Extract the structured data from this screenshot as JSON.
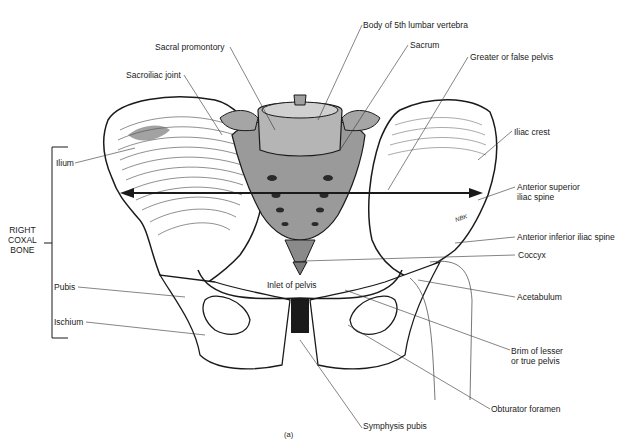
{
  "figure": {
    "caption": "(a)",
    "bracket_label": [
      "RIGHT",
      "COXAL",
      "BONE"
    ],
    "labels": {
      "sacral_promontory": "Sacral promontory",
      "sacroiliac_joint": "Sacroiliac joint",
      "body_5th_lumbar": "Body of 5th lumbar vertebra",
      "sacrum": "Sacrum",
      "greater_false_pelvis": "Greater or false pelvis",
      "iliac_crest": "Iliac crest",
      "asis_line1": "Anterior superior",
      "asis_line2": "iliac spine",
      "aiis": "Anterior inferior iliac spine",
      "coccyx": "Coccyx",
      "acetabulum": "Acetabulum",
      "brim_line1": "Brim of lesser",
      "brim_line2": "or true pelvis",
      "obturator_foramen": "Obturator foramen",
      "symphysis_pubis": "Symphysis pubis",
      "inlet_of_pelvis": "Inlet of pelvis",
      "ilium": "Ilium",
      "pubis": "Pubis",
      "ischium": "Ischium"
    },
    "signature": "NBK",
    "colors": {
      "bone_fill": "#ffffff",
      "sacrum_fill": "#9a9a9a",
      "line": "#1a1a1a",
      "leader": "#333333"
    }
  }
}
